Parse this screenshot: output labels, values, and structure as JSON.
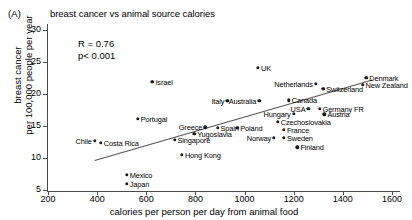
{
  "panel": {
    "letter": "(A)",
    "title": "breast cancer vs animal source calories"
  },
  "annotation": {
    "r_line": "R = 0.76",
    "p_line": "p< 0.001"
  },
  "chart_data": {
    "type": "scatter",
    "title": "breast cancer vs animal source calories",
    "xlabel": "calories per person per day from animal food",
    "ylabel": "breast cancer per 100,000 people per year",
    "ylabel_line1": "breast cancer",
    "ylabel_line2": "per 100,000 people per year",
    "xlim": [
      200,
      1650
    ],
    "ylim": [
      5,
      30
    ],
    "xticks": [
      200,
      400,
      600,
      800,
      1000,
      1200,
      1400,
      1600
    ],
    "yticks": [
      5,
      10,
      15,
      20,
      25,
      30
    ],
    "grid": false,
    "legend": "none",
    "correlation": 0.76,
    "p_value": "< 0.001",
    "trendline": {
      "x_start": 390,
      "y_start": 9.6,
      "x_end": 1520,
      "y_end": 22.2
    },
    "points": [
      {
        "label": "UK",
        "x": 1055,
        "y": 24.1,
        "label_pos": "right"
      },
      {
        "label": "Denmark",
        "x": 1495,
        "y": 22.5,
        "label_pos": "right"
      },
      {
        "label": "New Zealand",
        "x": 1480,
        "y": 21.4,
        "label_pos": "right"
      },
      {
        "label": "Netherlands",
        "x": 1290,
        "y": 21.6,
        "label_pos": "left"
      },
      {
        "label": "Switzerland",
        "x": 1320,
        "y": 20.8,
        "label_pos": "right"
      },
      {
        "label": "Canada",
        "x": 1180,
        "y": 19.0,
        "label_pos": "right"
      },
      {
        "label": "USA",
        "x": 1260,
        "y": 17.7,
        "label_pos": "left"
      },
      {
        "label": "Germany FR",
        "x": 1305,
        "y": 17.7,
        "label_pos": "right"
      },
      {
        "label": "Austria",
        "x": 1325,
        "y": 16.8,
        "label_pos": "right"
      },
      {
        "label": "Hungary",
        "x": 1200,
        "y": 16.9,
        "label_pos": "left"
      },
      {
        "label": "Israel",
        "x": 625,
        "y": 21.9,
        "label_pos": "right"
      },
      {
        "label": "Italy",
        "x": 930,
        "y": 18.9,
        "label_pos": "left"
      },
      {
        "label": "Australia",
        "x": 1060,
        "y": 18.9,
        "label_pos": "left"
      },
      {
        "label": "Czechoslovakia",
        "x": 1135,
        "y": 15.7,
        "label_pos": "right"
      },
      {
        "label": "France",
        "x": 1160,
        "y": 14.4,
        "label_pos": "right"
      },
      {
        "label": "Norway",
        "x": 1120,
        "y": 13.2,
        "label_pos": "left"
      },
      {
        "label": "Sweden",
        "x": 1160,
        "y": 13.2,
        "label_pos": "right"
      },
      {
        "label": "Finland",
        "x": 1215,
        "y": 11.7,
        "label_pos": "right"
      },
      {
        "label": "Portugal",
        "x": 565,
        "y": 16.1,
        "label_pos": "right"
      },
      {
        "label": "Greece",
        "x": 840,
        "y": 14.8,
        "label_pos": "left"
      },
      {
        "label": "Spain",
        "x": 890,
        "y": 14.7,
        "label_pos": "right"
      },
      {
        "label": "Poland",
        "x": 970,
        "y": 14.7,
        "label_pos": "right"
      },
      {
        "label": "Yugoslavia",
        "x": 795,
        "y": 13.8,
        "label_pos": "right"
      },
      {
        "label": "Singapore",
        "x": 715,
        "y": 12.8,
        "label_pos": "right"
      },
      {
        "label": "Chile",
        "x": 390,
        "y": 12.7,
        "label_pos": "left"
      },
      {
        "label": "Costa Rica",
        "x": 415,
        "y": 12.4,
        "label_pos": "right"
      },
      {
        "label": "Hong Kong",
        "x": 745,
        "y": 10.5,
        "label_pos": "right"
      },
      {
        "label": "Mexico",
        "x": 520,
        "y": 7.4,
        "label_pos": "right"
      },
      {
        "label": "Japan",
        "x": 520,
        "y": 6.0,
        "label_pos": "right"
      }
    ]
  }
}
